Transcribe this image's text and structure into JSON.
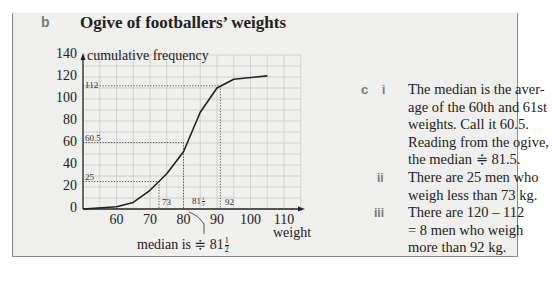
{
  "part_b": {
    "label": "b",
    "title": "Ogive of footballers’ weights"
  },
  "chart_data": {
    "type": "line",
    "title": "Ogive of footballers’ weights",
    "xlabel": "weight",
    "ylabel": "cumulative frequency",
    "xlim": [
      50,
      115
    ],
    "ylim": [
      0,
      140
    ],
    "x_ticks": [
      60,
      70,
      80,
      90,
      100,
      110
    ],
    "y_ticks": [
      0,
      20,
      40,
      60,
      80,
      100,
      120,
      140
    ],
    "grid": true,
    "x": [
      50,
      60,
      65,
      70,
      75,
      80,
      85,
      90,
      95,
      105
    ],
    "values": [
      0,
      2,
      6,
      17,
      32,
      52,
      88,
      110,
      118,
      121
    ],
    "annotations": [
      {
        "type": "hline",
        "y": 112,
        "x_to": 92,
        "label": "112"
      },
      {
        "type": "hline",
        "y": 60.5,
        "x_to": 81.5,
        "label": "60.5"
      },
      {
        "type": "hline",
        "y": 25,
        "x_to": 73,
        "label": "25"
      },
      {
        "type": "vline",
        "x": 73,
        "y_to": 25,
        "label": "73"
      },
      {
        "type": "vline",
        "x": 81.5,
        "y_to": 60.5,
        "label": "81½"
      },
      {
        "type": "vline",
        "x": 92,
        "y_to": 112,
        "label": "92"
      }
    ],
    "callout": "median is ≑ 81½"
  },
  "chart_labels": {
    "y_ticks": [
      "0",
      "20",
      "40",
      "60",
      "80",
      "100",
      "120",
      "140"
    ],
    "x_ticks": [
      "60",
      "70",
      "80",
      "90",
      "100",
      "110"
    ],
    "ylabel": "cumulative frequency",
    "xlabel": "weight",
    "ann_112": "112",
    "ann_605": "60.5",
    "ann_25": "25",
    "ann_73": "73",
    "ann_815_whole": "81",
    "ann_92": "92",
    "median_note_prefix": "median is ≑ 81",
    "frac_num": "1",
    "frac_den": "2"
  },
  "part_c": {
    "label": "c",
    "items": [
      {
        "numeral": "i",
        "lines": [
          "The median is the aver-",
          "age of the 60th and 61st",
          "weights. Call it 60.5.",
          "Reading from the ogive,",
          "the median ≑ 81.5."
        ]
      },
      {
        "numeral": "ii",
        "lines": [
          "There are 25 men who",
          "weigh less than 73 kg."
        ]
      },
      {
        "numeral": "iii",
        "lines": [
          "There are 120 – 112",
          "= 8 men who weigh",
          "more than 92 kg."
        ]
      }
    ]
  }
}
